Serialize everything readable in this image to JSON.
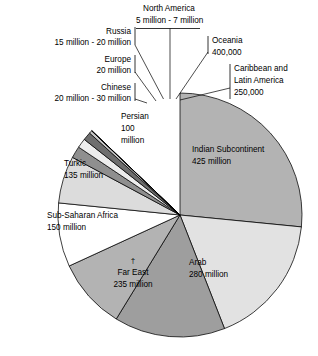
{
  "chart_data": {
    "type": "pie",
    "title": "",
    "subtitle": "",
    "xlabel": "",
    "ylabel": "",
    "legend_position": "none",
    "grid": false,
    "units": "people",
    "note_marker": "†",
    "categories": [
      "Indian Subcontinent",
      "Caribbean and Latin America",
      "Oceania",
      "North America",
      "Russia",
      "Europe",
      "Chinese",
      "Persian",
      "Turkic",
      "Sub-Saharan Africa",
      "Far East",
      "Arab"
    ],
    "values": [
      425000000,
      250000,
      400000,
      6000000,
      17500000,
      20000000,
      25000000,
      100000000,
      135000000,
      150000000,
      235000000,
      280000000
    ],
    "slices": [
      {
        "id": "indian-subcontinent",
        "name": "Indian Subcontinent",
        "value_label": "425 million",
        "value": 425000000,
        "label_placement": "inside",
        "color": "#b3b3b3",
        "start_angle": 0.0,
        "end_angle": 95.6
      },
      {
        "id": "arab",
        "name": "Arab",
        "value_label": "280 million",
        "value": 280000000,
        "label_placement": "inside",
        "color": "#e2e2e2",
        "start_angle": 95.6,
        "end_angle": 158.6
      },
      {
        "id": "far-east",
        "name": "Far East",
        "value_label": "235 million",
        "value": 235000000,
        "label_placement": "inside",
        "color": "#9e9e9e",
        "start_angle": 158.6,
        "end_angle": 211.5
      },
      {
        "id": "sub-saharan-africa",
        "name": "Sub-Saharan Africa",
        "value_label": "150 million",
        "value": 150000000,
        "label_placement": "inside",
        "color": "#b3b3b3",
        "start_angle": 211.5,
        "end_angle": 245.3
      },
      {
        "id": "turkic",
        "name": "Turkic",
        "value_label": "135 million",
        "value": 135000000,
        "label_placement": "inside",
        "color": "#ffffff",
        "start_angle": 245.3,
        "end_angle": 275.7
      },
      {
        "id": "persian",
        "name": "Persian",
        "value_label": "100 million",
        "value": 100000000,
        "label_placement": "inside",
        "color": "#dcdcdc",
        "start_angle": 275.7,
        "end_angle": 298.2
      },
      {
        "id": "chinese",
        "name": "Chinese",
        "value_label": "20 million - 30 million",
        "value": 25000000,
        "label_placement": "callout-left",
        "color": "#8f8f8f",
        "start_angle": 298.2,
        "end_angle": 303.8
      },
      {
        "id": "europe",
        "name": "Europe",
        "value_label": "20 million",
        "value": 20000000,
        "label_placement": "callout-left",
        "color": "#ededed",
        "start_angle": 303.8,
        "end_angle": 308.3
      },
      {
        "id": "russia",
        "name": "Russia",
        "value_label": "15 million - 20 million",
        "value": 17500000,
        "label_placement": "callout-left",
        "color": "#6e6e6e",
        "start_angle": 308.3,
        "end_angle": 312.2
      },
      {
        "id": "north-america",
        "name": "North America",
        "value_label": "5 million - 7 million",
        "value": 6000000,
        "label_placement": "callout-top",
        "color": "#c9c9c9",
        "start_angle": 312.2,
        "end_angle": 313.6
      },
      {
        "id": "oceania",
        "name": "Oceania",
        "value_label": "400,000",
        "value": 400000,
        "label_placement": "callout-right",
        "color": "#6e6e6e",
        "start_angle": 313.6,
        "end_angle": 313.7
      },
      {
        "id": "caribbean-latin-america",
        "name": "Caribbean and Latin America",
        "value_label": "250,000",
        "value": 250000,
        "label_placement": "callout-right",
        "color": "#8f8f8f",
        "start_angle": 313.7,
        "end_angle": 313.75
      }
    ]
  },
  "callouts": {
    "north_america": {
      "line1": "North America",
      "line2": "5 million - 7 million"
    },
    "russia": {
      "line1": "Russia",
      "line2": "15 million - 20 million"
    },
    "europe": {
      "line1": "Europe",
      "line2": "20 million"
    },
    "chinese": {
      "line1": "Chinese",
      "line2": "20 million - 30 million"
    },
    "oceania": {
      "line1": "Oceania",
      "line2": "400,000"
    },
    "caribbean": {
      "line1": "Caribbean and",
      "line2": "Latin America",
      "line3": "250,000"
    }
  },
  "inside_labels": {
    "indian": {
      "line1": "Indian Subcontinent",
      "line2": "425 million"
    },
    "arab": {
      "line1": "Arab",
      "line2": "280 million"
    },
    "far_east": {
      "marker": "†",
      "line1": "Far East",
      "line2": "235 million"
    },
    "sub_saharan": {
      "line1": "Sub-Saharan Africa",
      "line2": "150 million"
    },
    "turkic": {
      "line1": "Turkic",
      "line2": "135 million"
    },
    "persian": {
      "line1": "Persian",
      "line2": "100",
      "line3": "million"
    }
  }
}
